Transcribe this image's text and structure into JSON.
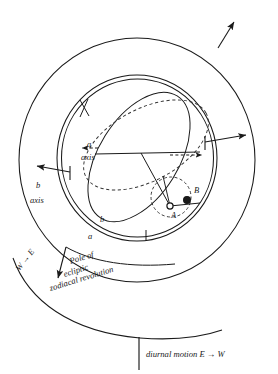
{
  "figure": {
    "background_color": "#ffffff",
    "stroke_color": "#1a1a1a",
    "dash_color": "#333333"
  },
  "labels": {
    "a_axis_letter": "a",
    "a_axis_word": "axis",
    "b_axis_letter": "b",
    "b_axis_word": "axis",
    "ring_b": "b",
    "ring_a": "a",
    "point_a": "A",
    "point_b": "B",
    "pole_line1": "Pole of",
    "pole_line2": "ecliptic",
    "pole_line3": "zodiacal revolution",
    "west_east": "W → E",
    "diurnal": "diurnal motion E → W"
  },
  "markers": [
    {
      "name": "point-a",
      "label": "A",
      "style": "open-circle",
      "cx": 170,
      "cy": 206
    },
    {
      "name": "point-b",
      "label": "B",
      "style": "filled-circle",
      "cx": 187,
      "cy": 200
    }
  ],
  "arrows": [
    {
      "name": "outer-sphere-rotation-arrow",
      "direction": "up-right"
    },
    {
      "name": "a-axis-arrow-right",
      "direction": "right"
    },
    {
      "name": "a-axis-arrow-left",
      "direction": "left"
    },
    {
      "name": "b-axis-arrow",
      "direction": "left"
    },
    {
      "name": "a-axis-dashed-arrow-right",
      "direction": "right"
    },
    {
      "name": "pole-of-ecliptic-arrow",
      "direction": "down-left"
    }
  ],
  "colors": {
    "ink": "#1a1a1a",
    "paper": "#ffffff"
  }
}
